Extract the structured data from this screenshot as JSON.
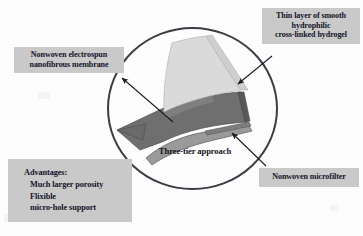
{
  "figure": {
    "kind": "scientific-diagram",
    "center_caption": "Three-tier approach",
    "circle": {
      "stroke_color": "#3c3c44",
      "fill": "none"
    },
    "background_color": "#fdfdfd"
  },
  "callouts": {
    "hydrogel": {
      "line1": "Thin layer of smooth",
      "line2": "hydrophilic",
      "line3": "cross-linked hydrogel",
      "box_color": "#c9c9c9",
      "text_color": "#141428"
    },
    "nanofibrous": {
      "line1": "Nonwoven electrospun",
      "line2": "nanofibrous membrane",
      "box_color": "#c9c9c9",
      "text_color": "#141428"
    },
    "microfilter": {
      "line1": "Nonwoven microfilter",
      "box_color": "#c9c9c9",
      "text_color": "#141428"
    },
    "advantages": {
      "heading": "Advantages:",
      "items": [
        "Much larger porosity",
        "Flixible",
        "micro-hole support"
      ],
      "box_color": "#c9c9c9",
      "text_color": "#141428"
    }
  },
  "layers": {
    "top": {
      "name": "hydrogel-layer",
      "color": "#d9d9d9"
    },
    "middle": {
      "name": "nanofibrous-membrane-layer",
      "color": "#6f6f6f"
    },
    "bottom": {
      "name": "microfilter-layer",
      "color": "#9a9a9a"
    }
  },
  "arrows": {
    "hydrogel_arrow": "arrow-to-hydrogel-layer",
    "nanofibrous_arrow": "arrow-to-nanofibrous-layer",
    "microfilter_arrow": "arrow-to-microfilter-layer"
  }
}
